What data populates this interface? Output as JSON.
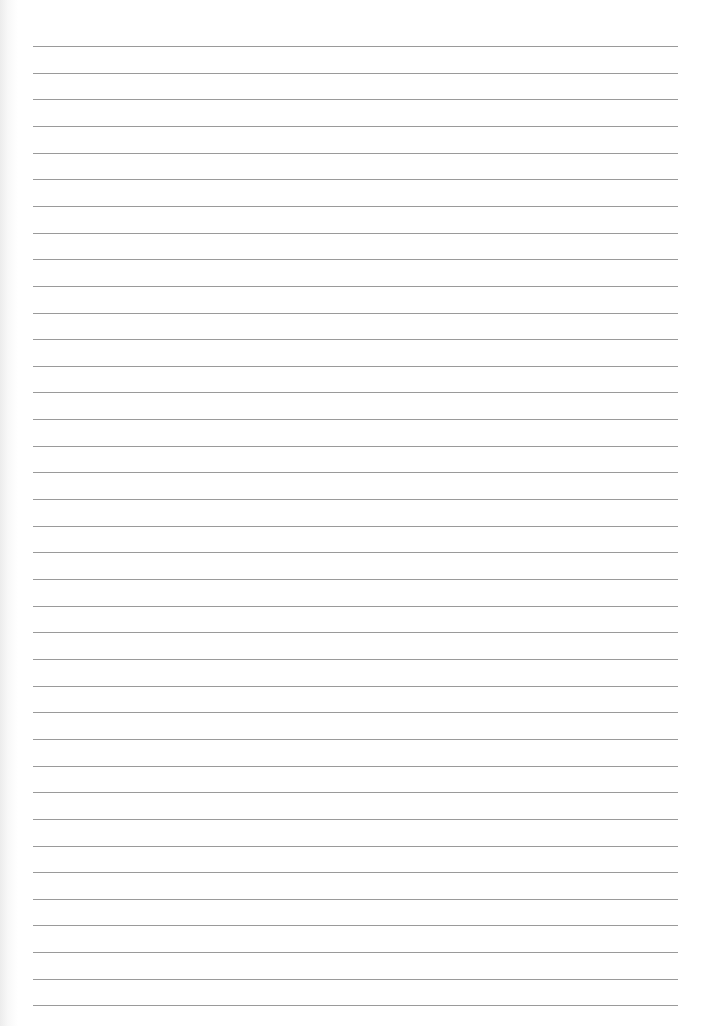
{
  "page": {
    "type": "lined-paper",
    "line_count": 37,
    "first_line_y": 46,
    "line_spacing": 26.65,
    "line_left": 33,
    "line_width": 645,
    "line_style": "dotted",
    "line_color": "#9a9a9a",
    "background_color": "#ffffff"
  }
}
